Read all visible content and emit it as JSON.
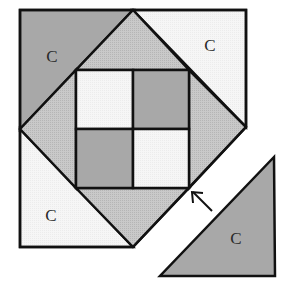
{
  "diagram": {
    "colors": {
      "dark_gray": "#a6a6a6",
      "medium_gray": "#c4c4c4",
      "light": "#f4f4f4",
      "white": "#ffffff",
      "stroke": "#111111"
    },
    "pieces": {
      "corner_top_left": {
        "label": "C",
        "shade": "dark_gray"
      },
      "corner_top_right": {
        "label": "C",
        "shade": "light"
      },
      "corner_bottom_left": {
        "label": "C",
        "shade": "light"
      },
      "corner_bottom_right_detached": {
        "label": "C",
        "shade": "dark_gray"
      },
      "setting_triangles": {
        "shade": "medium_gray",
        "count": 4
      },
      "center_four_patch": {
        "squares": [
          {
            "position": "top-left",
            "shade": "light"
          },
          {
            "position": "top-right",
            "shade": "dark_gray"
          },
          {
            "position": "bottom-left",
            "shade": "dark_gray"
          },
          {
            "position": "bottom-right",
            "shade": "light"
          }
        ]
      }
    },
    "labels": [
      {
        "id": "c-top-left",
        "text": "C"
      },
      {
        "id": "c-top-right",
        "text": "C"
      },
      {
        "id": "c-bottom-left",
        "text": "C"
      },
      {
        "id": "c-detached",
        "text": "C"
      }
    ],
    "arrow": {
      "direction": "up-left",
      "meaning": "attach triangle C to block"
    }
  }
}
